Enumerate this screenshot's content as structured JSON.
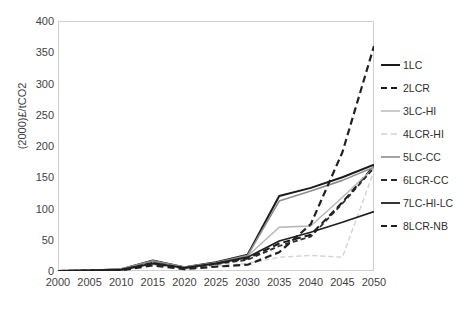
{
  "chart_data": {
    "type": "line",
    "title": "",
    "xlabel": "",
    "ylabel": "(2000)£/tCO2",
    "x": [
      2000,
      2005,
      2010,
      2015,
      2020,
      2025,
      2030,
      2035,
      2040,
      2045,
      2050
    ],
    "xlim": [
      2000,
      2050
    ],
    "ylim": [
      0,
      400
    ],
    "ytick_labels": [
      "0",
      "50",
      "100",
      "150",
      "200",
      "250",
      "300",
      "350",
      "400"
    ],
    "yticks": [
      0,
      50,
      100,
      150,
      200,
      250,
      300,
      350,
      400
    ],
    "xtick_labels": [
      "2000",
      "2005",
      "2010",
      "2015",
      "2020",
      "2025",
      "2030",
      "2035",
      "2040",
      "2045",
      "2050"
    ],
    "grid": false,
    "legend_position": "right",
    "series": [
      {
        "name": "1LC",
        "color": "#1a1a1a",
        "dash": "solid",
        "width": 2.0,
        "values": [
          0,
          1,
          3,
          17,
          6,
          14,
          26,
          120,
          133,
          150,
          170
        ]
      },
      {
        "name": "2LCR",
        "color": "#1a1a1a",
        "dash": "dashed",
        "width": 2.0,
        "values": [
          0,
          1,
          2,
          14,
          5,
          12,
          20,
          44,
          58,
          110,
          168
        ]
      },
      {
        "name": "3LC-HI",
        "color": "#b4b4b4",
        "dash": "solid",
        "width": 1.4,
        "values": [
          0,
          1,
          3,
          16,
          6,
          13,
          24,
          70,
          72,
          118,
          165
        ]
      },
      {
        "name": "4LCR-HI",
        "color": "#d2d2d2",
        "dash": "dashed",
        "width": 1.4,
        "values": [
          0,
          0,
          1,
          10,
          3,
          8,
          12,
          22,
          25,
          22,
          160
        ]
      },
      {
        "name": "5LC-CC",
        "color": "#8c8c8c",
        "dash": "solid",
        "width": 1.6,
        "values": [
          0,
          1,
          3,
          16,
          6,
          13,
          25,
          112,
          128,
          145,
          166
        ]
      },
      {
        "name": "6LCR-CC",
        "color": "#2b2b2b",
        "dash": "dashed",
        "width": 1.8,
        "values": [
          0,
          1,
          2,
          13,
          5,
          11,
          18,
          40,
          55,
          108,
          165
        ]
      },
      {
        "name": "7LC-HI-LC",
        "color": "#1f1f1f",
        "dash": "solid",
        "width": 1.8,
        "values": [
          0,
          1,
          2,
          12,
          5,
          12,
          22,
          48,
          62,
          78,
          95
        ]
      },
      {
        "name": "8LCR-NB",
        "color": "#202020",
        "dash": "dashed",
        "width": 2.2,
        "values": [
          0,
          0,
          1,
          9,
          3,
          7,
          10,
          30,
          75,
          190,
          360
        ]
      }
    ]
  },
  "legend": {
    "items": [
      {
        "label": "1LC"
      },
      {
        "label": "2LCR"
      },
      {
        "label": "3LC-HI"
      },
      {
        "label": "4LCR-HI"
      },
      {
        "label": "5LC-CC"
      },
      {
        "label": "6LCR-CC"
      },
      {
        "label": "7LC-HI-LC"
      },
      {
        "label": "8LCR-NB"
      }
    ]
  },
  "axes": {
    "frame_color": "#cfcfcf",
    "tick_color": "#bdbdbd",
    "label_color": "#3f3f3f"
  }
}
